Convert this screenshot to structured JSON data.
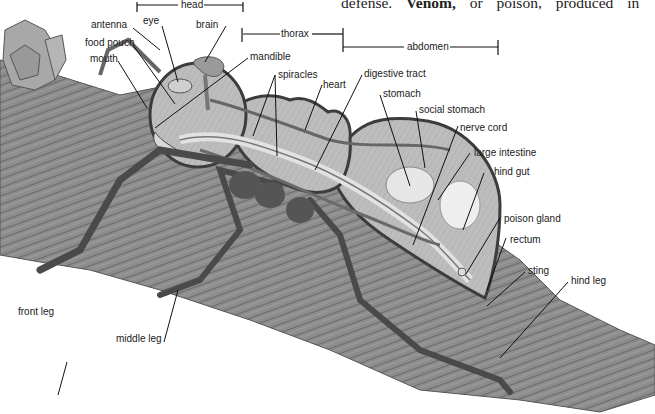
{
  "page_text": {
    "prefix": "defense.",
    "bold_term": "Venom,",
    "suffix": "or poison, produced in"
  },
  "diagram": {
    "colors": {
      "branch": "#8a8a8a",
      "branch_dark": "#5a5a5a",
      "body_fill": "#b8b8b8",
      "body_outline": "#3c3c3c",
      "organ_light": "#dcdcdc",
      "leader_line": "#111111"
    },
    "body_regions": [
      {
        "id": "head",
        "label": "head"
      },
      {
        "id": "thorax",
        "label": "thorax"
      },
      {
        "id": "abdomen",
        "label": "abdomen"
      }
    ],
    "labels": {
      "antenna": "antenna",
      "eye": "eye",
      "brain": "brain",
      "food_pouch": "food pouch",
      "mouth": "mouth",
      "mandible": "mandible",
      "spiracles": "spiracles",
      "heart": "heart",
      "digestive_tract": "digestive tract",
      "stomach": "stomach",
      "social_stomach": "social stomach",
      "nerve_cord": "nerve cord",
      "large_intestine": "large intestine",
      "hind_gut": "hind gut",
      "poison_gland": "poison gland",
      "rectum": "rectum",
      "sting": "sting",
      "hind_leg": "hind leg",
      "front_leg": "front leg",
      "middle_leg": "middle leg"
    }
  }
}
